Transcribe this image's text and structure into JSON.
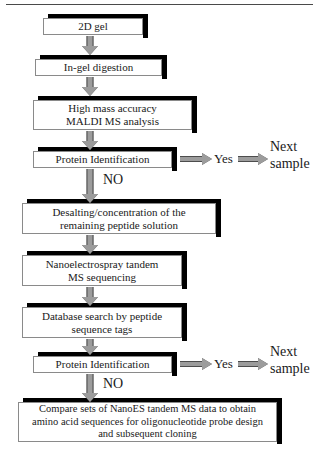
{
  "figure": {
    "type": "flowchart",
    "orientation": "top-to-bottom"
  },
  "nodes": [
    {
      "id": "n1",
      "label": "2D gel"
    },
    {
      "id": "n2",
      "label": "In-gel digestion"
    },
    {
      "id": "n3",
      "label": "High mass accuracy\nMALDI MS analysis"
    },
    {
      "id": "n4",
      "label": "Protein Identification"
    },
    {
      "id": "n5",
      "label": "Desalting/concentration of the\nremaining peptide solution"
    },
    {
      "id": "n6",
      "label": "Nanoelectrospray tandem\nMS sequencing"
    },
    {
      "id": "n7",
      "label": "Database search by peptide\nsequence tags"
    },
    {
      "id": "n8",
      "label": "Protein Identification"
    },
    {
      "id": "n9",
      "label": "Compare sets of NanoES tandem MS data to obtain\namino acid sequences for oligonucleotide probe design\nand subsequent cloning"
    }
  ],
  "branch_labels": {
    "yes_1": "Yes",
    "yes_2": "Yes",
    "no_1": "NO",
    "no_2": "NO",
    "next_sample_1": "Next\nsample",
    "next_sample_2": "Next\nsample"
  },
  "colors": {
    "box_fill": "#ffffff",
    "box_border": "#8a8a8a",
    "shadow": "#000000",
    "arrow_fill": "#9c9c9c",
    "arrow_outline": "#4d4d4d",
    "text": "#1a1a1a",
    "background": "#ffffff"
  }
}
